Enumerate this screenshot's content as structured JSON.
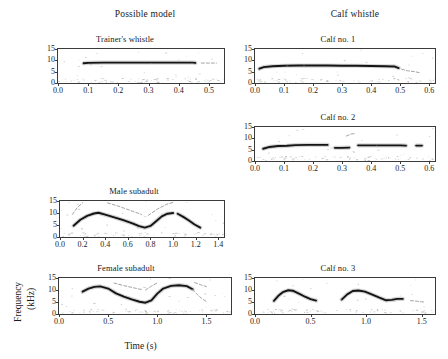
{
  "figure": {
    "column_headers": [
      {
        "label": "Possible model"
      },
      {
        "label": "Calf whistle"
      }
    ],
    "axis_labels": {
      "y_line1": "Frequency",
      "y_line2": "(kHz)",
      "x": "Time (s)"
    }
  },
  "chart_data": [
    {
      "type": "line",
      "title": "Trainer's whistle",
      "xlabel": "",
      "ylabel": "Frequency (kHz)",
      "xlim": [
        0.0,
        0.55
      ],
      "ylim": [
        0,
        15
      ],
      "xticks": [
        "0.0",
        "0.1",
        "0.2",
        "0.3",
        "0.4",
        "0.5"
      ],
      "xtick_values": [
        0.0,
        0.1,
        0.2,
        0.3,
        0.4,
        0.5
      ],
      "yticks": [
        "0",
        "5",
        "10",
        "15"
      ],
      "ytick_values": [
        0,
        5,
        10,
        15
      ],
      "grid": false,
      "series": [
        {
          "name": "fundamental",
          "x": [
            0.085,
            0.1,
            0.15,
            0.2,
            0.25,
            0.3,
            0.35,
            0.4,
            0.445,
            0.455
          ],
          "values": [
            8.7,
            8.9,
            9.0,
            9.0,
            9.0,
            9.0,
            9.0,
            9.0,
            9.0,
            8.9
          ]
        },
        {
          "name": "tail",
          "x": [
            0.475,
            0.5,
            0.525
          ],
          "values": [
            8.8,
            8.8,
            8.8
          ]
        }
      ]
    },
    {
      "type": "line",
      "title": "Calf no. 1",
      "xlabel": "",
      "ylabel": "Frequency (kHz)",
      "xlim": [
        0.0,
        0.62
      ],
      "ylim": [
        0,
        15
      ],
      "xticks": [
        "0.0",
        "0.1",
        "0.2",
        "0.3",
        "0.4",
        "0.5",
        "0.6"
      ],
      "xtick_values": [
        0.0,
        0.1,
        0.2,
        0.3,
        0.4,
        0.5,
        0.6
      ],
      "yticks": [
        "0",
        "5",
        "10",
        "15"
      ],
      "ytick_values": [
        0,
        5,
        10,
        15
      ],
      "grid": false,
      "series": [
        {
          "name": "fundamental",
          "x": [
            0.015,
            0.03,
            0.06,
            0.1,
            0.15,
            0.2,
            0.25,
            0.3,
            0.35,
            0.4,
            0.45,
            0.48,
            0.495
          ],
          "values": [
            6.3,
            7.0,
            7.4,
            7.6,
            7.7,
            7.7,
            7.7,
            7.6,
            7.6,
            7.5,
            7.4,
            7.3,
            6.6
          ]
        },
        {
          "name": "tail",
          "x": [
            0.505,
            0.525,
            0.55,
            0.565
          ],
          "values": [
            6.1,
            5.4,
            5.0,
            4.6
          ]
        }
      ]
    },
    {
      "type": "line",
      "title": "Calf no. 2",
      "xlabel": "",
      "ylabel": "Frequency (kHz)",
      "xlim": [
        0.0,
        0.62
      ],
      "ylim": [
        0,
        15
      ],
      "xticks": [
        "0.0",
        "0.1",
        "0.2",
        "0.3",
        "0.4",
        "0.5",
        "0.6"
      ],
      "xtick_values": [
        0.0,
        0.1,
        0.2,
        0.3,
        0.4,
        0.5,
        0.6
      ],
      "yticks": [
        "0",
        "5",
        "10",
        "15"
      ],
      "ytick_values": [
        0,
        5,
        10,
        15
      ],
      "grid": false,
      "series": [
        {
          "name": "segment-1",
          "x": [
            0.028,
            0.05,
            0.08,
            0.11,
            0.14,
            0.18,
            0.22,
            0.25
          ],
          "values": [
            5.4,
            6.2,
            6.6,
            6.7,
            7.0,
            7.1,
            7.1,
            7.1
          ]
        },
        {
          "name": "segment-2",
          "x": [
            0.275,
            0.3,
            0.325
          ],
          "values": [
            5.8,
            5.8,
            5.9
          ]
        },
        {
          "name": "segment-3",
          "x": [
            0.355,
            0.4,
            0.45,
            0.5,
            0.52
          ],
          "values": [
            6.9,
            6.9,
            6.9,
            6.9,
            6.8
          ]
        },
        {
          "name": "segment-4",
          "x": [
            0.555,
            0.575
          ],
          "values": [
            6.8,
            6.8
          ]
        },
        {
          "name": "harmonic-fragment",
          "x": [
            0.315,
            0.33,
            0.345
          ],
          "values": [
            11.0,
            11.9,
            12.1
          ]
        }
      ]
    },
    {
      "type": "line",
      "title": "Male subadult",
      "xlabel": "",
      "ylabel": "Frequency (kHz)",
      "xlim": [
        0.0,
        1.45
      ],
      "ylim": [
        0,
        15
      ],
      "xticks": [
        "0.0",
        "0.2",
        "0.4",
        "0.6",
        "0.8",
        "1.0",
        "1.2",
        "1.4"
      ],
      "xtick_values": [
        0.0,
        0.2,
        0.4,
        0.6,
        0.8,
        1.0,
        1.2,
        1.4
      ],
      "yticks": [
        "0",
        "5",
        "10",
        "15"
      ],
      "ytick_values": [
        0,
        5,
        10,
        15
      ],
      "grid": false,
      "series": [
        {
          "name": "fundamental",
          "x": [
            0.12,
            0.18,
            0.24,
            0.3,
            0.34,
            0.4,
            0.48,
            0.56,
            0.64,
            0.7,
            0.75,
            0.8,
            0.85,
            0.9,
            0.95,
            1.0
          ],
          "values": [
            4.7,
            7.2,
            8.8,
            9.8,
            10.1,
            9.3,
            8.2,
            7.0,
            5.7,
            4.5,
            3.9,
            4.6,
            6.6,
            8.6,
            9.7,
            10.0
          ]
        },
        {
          "name": "second-pulse",
          "x": [
            1.04,
            1.09,
            1.14,
            1.19,
            1.24
          ],
          "values": [
            9.7,
            8.4,
            6.9,
            5.2,
            3.9
          ]
        },
        {
          "name": "harmonic-a",
          "x": [
            0.11,
            0.15,
            0.2
          ],
          "values": [
            9.4,
            12.1,
            14.3
          ]
        },
        {
          "name": "harmonic-b",
          "x": [
            0.42,
            0.52,
            0.62,
            0.72
          ],
          "values": [
            14.2,
            12.8,
            11.1,
            9.4
          ]
        },
        {
          "name": "harmonic-c",
          "x": [
            0.78,
            0.86,
            0.94,
            1.0
          ],
          "values": [
            9.0,
            11.6,
            13.6,
            14.4
          ]
        }
      ]
    },
    {
      "type": "line",
      "title": "Female subadult",
      "xlabel": "Time (s)",
      "ylabel": "Frequency (kHz)",
      "xlim": [
        0.0,
        1.75
      ],
      "ylim": [
        0,
        15
      ],
      "xticks": [
        "0.0",
        "0.5",
        "1.0",
        "1.5"
      ],
      "xtick_values": [
        0.0,
        0.5,
        1.0,
        1.5
      ],
      "yticks": [
        "0",
        "5",
        "10",
        "15"
      ],
      "ytick_values": [
        0,
        5,
        10,
        15
      ],
      "grid": false,
      "series": [
        {
          "name": "fundamental",
          "x": [
            0.24,
            0.3,
            0.36,
            0.42,
            0.5,
            0.58,
            0.66,
            0.74,
            0.82,
            0.88,
            0.94,
            1.0,
            1.06,
            1.14,
            1.22,
            1.3,
            1.36
          ],
          "values": [
            9.3,
            10.6,
            11.3,
            11.5,
            10.6,
            8.6,
            7.2,
            6.1,
            5.1,
            4.7,
            5.7,
            8.5,
            10.6,
            11.7,
            12.0,
            11.6,
            10.3
          ]
        },
        {
          "name": "down-sweep-tail",
          "x": [
            1.36,
            1.4,
            1.45,
            1.5
          ],
          "values": [
            10.3,
            8.4,
            6.5,
            5.2
          ]
        },
        {
          "name": "harmonic-a",
          "x": [
            0.56,
            0.66,
            0.76,
            0.84
          ],
          "values": [
            12.9,
            11.8,
            10.9,
            10.2
          ]
        },
        {
          "name": "harmonic-b",
          "x": [
            0.88,
            0.94,
            1.0
          ],
          "values": [
            10.0,
            11.6,
            13.0
          ]
        },
        {
          "name": "harmonic-c",
          "x": [
            1.38,
            1.44,
            1.5
          ],
          "values": [
            13.1,
            12.2,
            11.4
          ]
        }
      ]
    },
    {
      "type": "line",
      "title": "Calf no. 3",
      "xlabel": "",
      "ylabel": "Frequency (kHz)",
      "xlim": [
        0.0,
        1.62
      ],
      "ylim": [
        0,
        15
      ],
      "xticks": [
        "0.0",
        "0.5",
        "1.0",
        "1.5"
      ],
      "xtick_values": [
        0.0,
        0.5,
        1.0,
        1.5
      ],
      "yticks": [
        "0",
        "5",
        "10",
        "15"
      ],
      "ytick_values": [
        0,
        5,
        10,
        15
      ],
      "grid": false,
      "series": [
        {
          "name": "pulse-1",
          "x": [
            0.17,
            0.21,
            0.25,
            0.3,
            0.34,
            0.4,
            0.45,
            0.5,
            0.55
          ],
          "values": [
            5.5,
            7.6,
            9.1,
            9.9,
            9.7,
            8.4,
            7.2,
            6.2,
            5.6
          ]
        },
        {
          "name": "pulse-2",
          "x": [
            0.78,
            0.83,
            0.88,
            0.93,
            0.99,
            1.05,
            1.12,
            1.18,
            1.23,
            1.28,
            1.33
          ],
          "values": [
            6.0,
            8.2,
            9.6,
            9.8,
            9.3,
            8.2,
            6.8,
            5.7,
            5.9,
            6.3,
            6.3
          ]
        },
        {
          "name": "tail",
          "x": [
            1.4,
            1.46,
            1.52
          ],
          "values": [
            5.6,
            5.3,
            5.0
          ]
        }
      ]
    }
  ]
}
